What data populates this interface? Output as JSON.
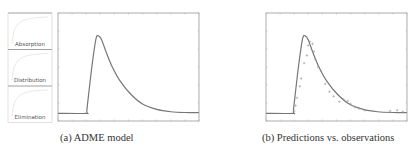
{
  "figures": [
    {
      "caption": "(a) ADME model",
      "compartments": [
        "Absorption",
        "Distribution",
        "Elimination"
      ]
    },
    {
      "caption": "(b) Predictions vs. observations"
    }
  ],
  "chart_data": [
    {
      "type": "line",
      "title": "ADME model",
      "xlabel": "",
      "ylabel": "",
      "grid": false,
      "series": [
        {
          "name": "model prediction",
          "x": [
            0,
            20,
            20.5,
            24,
            27,
            29,
            31,
            34,
            38,
            44,
            52,
            60,
            70,
            80,
            90,
            100
          ],
          "y": [
            0,
            0,
            0.05,
            0.6,
            0.97,
            1.0,
            0.95,
            0.8,
            0.62,
            0.42,
            0.24,
            0.12,
            0.05,
            0.02,
            0.01,
            0.01
          ]
        }
      ],
      "xlim": [
        0,
        100
      ],
      "ylim": [
        -0.1,
        1.3
      ]
    },
    {
      "type": "line",
      "title": "Predictions vs. observations",
      "xlabel": "",
      "ylabel": "",
      "grid": false,
      "series": [
        {
          "name": "prediction",
          "x": [
            0,
            19,
            19.5,
            23,
            26,
            28,
            30,
            33,
            37,
            43,
            51,
            59,
            69,
            79,
            90,
            100
          ],
          "y": [
            0,
            0,
            0.05,
            0.6,
            0.97,
            1.0,
            0.95,
            0.8,
            0.62,
            0.42,
            0.24,
            0.12,
            0.05,
            0.02,
            0.01,
            0.01
          ]
        },
        {
          "name": "observations",
          "type": "scatter",
          "x": [
            20,
            21,
            22,
            24,
            25,
            27,
            29,
            30,
            31,
            33,
            34,
            35,
            37,
            39,
            42,
            45,
            48,
            52,
            55,
            58,
            60,
            63,
            66,
            70,
            88,
            93,
            97
          ],
          "y": [
            0.03,
            0.1,
            0.2,
            0.35,
            0.45,
            0.65,
            0.75,
            0.88,
            0.93,
            0.9,
            0.8,
            0.7,
            0.6,
            0.55,
            0.38,
            0.28,
            0.22,
            0.15,
            0.18,
            0.16,
            0.12,
            0.08,
            0.06,
            0.04,
            0.03,
            0.04,
            0.02
          ]
        }
      ],
      "xlim": [
        0,
        100
      ],
      "ylim": [
        -0.1,
        1.3
      ]
    }
  ]
}
